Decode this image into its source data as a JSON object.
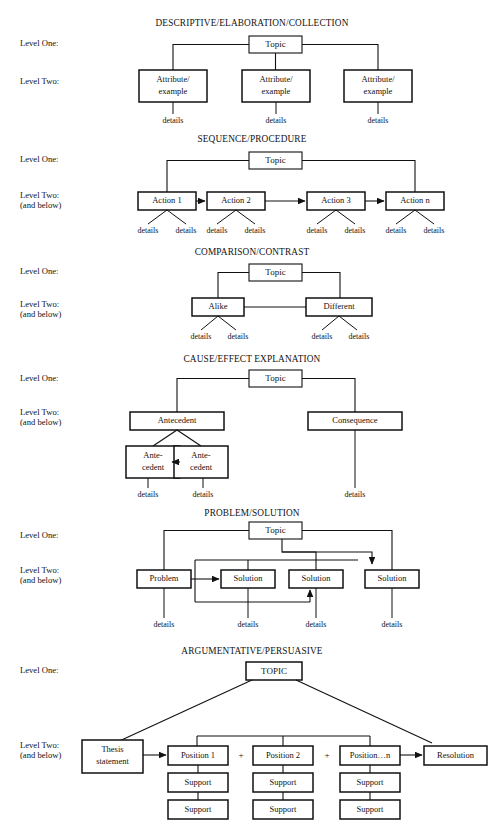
{
  "document": {
    "kind": "text-structure-diagrams",
    "labels": {
      "level_one": "Level One:",
      "level_two": "Level Two:",
      "level_two_sub": "(and below)",
      "details": "details",
      "plus": "+"
    }
  },
  "sections": [
    {
      "id": "descriptive",
      "title": "DESCRIPTIVE/ELABORATION/COLLECTION",
      "level_one_label": "Level One:",
      "level_two_label": "Level Two:",
      "level_two_sub": "",
      "root": "Topic",
      "children": [
        "Attribute/\nexample",
        "Attribute/\nexample",
        "Attribute/\nexample"
      ],
      "child_line1": "Attribute/",
      "child_line2": "example",
      "details": [
        "details",
        "details",
        "details"
      ]
    },
    {
      "id": "sequence",
      "title": "SEQUENCE/PROCEDURE",
      "level_one_label": "Level One:",
      "level_two_label": "Level Two:",
      "level_two_sub": "(and below)",
      "root": "Topic",
      "children": [
        "Action 1",
        "Action 2",
        "Action 3",
        "Action n"
      ],
      "details": [
        "details",
        "details",
        "details",
        "details",
        "details",
        "details",
        "details",
        "details"
      ]
    },
    {
      "id": "comparison",
      "title": "COMPARISON/CONTRAST",
      "level_one_label": "Level One:",
      "level_two_label": "Level Two:",
      "level_two_sub": "(and below)",
      "root": "Topic",
      "children": [
        "Alike",
        "Different"
      ],
      "details": [
        "details",
        "details",
        "details",
        "details"
      ]
    },
    {
      "id": "cause-effect",
      "title": "CAUSE/EFFECT EXPLANATION",
      "level_one_label": "Level One:",
      "level_two_label": "Level Two:",
      "level_two_sub": "(and below)",
      "root": "Topic",
      "children": [
        "Antecedent",
        "Consequence"
      ],
      "grandchild_line1": "Ante-",
      "grandchild_line2": "cedent",
      "grandchildren": [
        "Ante-\ncedent",
        "Ante-\ncedent"
      ],
      "details": [
        "details",
        "details",
        "details"
      ]
    },
    {
      "id": "problem-solution",
      "title": "PROBLEM/SOLUTION",
      "level_one_label": "Level One:",
      "level_two_label": "Level Two:",
      "level_two_sub": "(and below)",
      "root": "Topic",
      "children": [
        "Problem",
        "Solution",
        "Solution",
        "Solution"
      ],
      "details": [
        "details",
        "details",
        "details",
        "details"
      ]
    },
    {
      "id": "argumentative",
      "title": "ARGUMENTATIVE/PERSUASIVE",
      "level_one_label": "Level One:",
      "level_two_label": "Level Two:",
      "level_two_sub": "(and below)",
      "root": "TOPIC",
      "thesis_line1": "Thesis",
      "thesis_line2": "statement",
      "positions": [
        "Position 1",
        "Position 2",
        "Position…n"
      ],
      "plus_signs": [
        "+",
        "+"
      ],
      "resolution": "Resolution",
      "supports": [
        "Support",
        "Support",
        "Support",
        "Support",
        "Support",
        "Support"
      ]
    }
  ],
  "colors": {
    "ink": "#121212",
    "stroke": "#111111",
    "background": "#ffffff"
  }
}
